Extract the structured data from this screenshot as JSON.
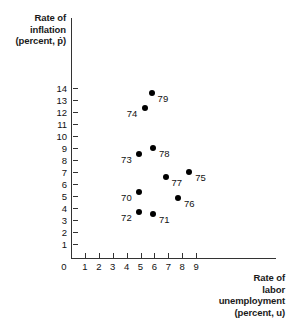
{
  "chart_data": {
    "type": "scatter",
    "title": "",
    "xlabel": "Rate of labor unemployment (percent, u)",
    "ylabel": "Rate of inflation (percent, p-dot)",
    "xlim": [
      0,
      9
    ],
    "ylim": [
      0,
      14
    ],
    "grid": false,
    "legend": "none",
    "xticks": [
      "0",
      "1",
      "2",
      "3",
      "4",
      "5",
      "6",
      "7",
      "8",
      "9"
    ],
    "yticks": [
      "1",
      "2",
      "3",
      "4",
      "5",
      "6",
      "7",
      "8",
      "9",
      "10",
      "11",
      "12",
      "13",
      "14"
    ],
    "points": [
      {
        "label": "70",
        "x": 4.9,
        "y": 5.3,
        "label_side": "left"
      },
      {
        "label": "71",
        "x": 5.9,
        "y": 3.5,
        "label_side": "right"
      },
      {
        "label": "72",
        "x": 4.9,
        "y": 3.7,
        "label_side": "left"
      },
      {
        "label": "73",
        "x": 4.9,
        "y": 8.5,
        "label_side": "left"
      },
      {
        "label": "74",
        "x": 5.3,
        "y": 12.3,
        "label_side": "left"
      },
      {
        "label": "75",
        "x": 8.5,
        "y": 7.0,
        "label_side": "right"
      },
      {
        "label": "76",
        "x": 7.7,
        "y": 4.8,
        "label_side": "right"
      },
      {
        "label": "77",
        "x": 6.8,
        "y": 6.6,
        "label_side": "right"
      },
      {
        "label": "78",
        "x": 5.9,
        "y": 9.0,
        "label_side": "right"
      },
      {
        "label": "79",
        "x": 5.8,
        "y": 13.6,
        "label_side": "right"
      }
    ]
  },
  "y_axis_title": {
    "line1": "Rate of",
    "line2": "inflation",
    "line3": "(percent, ṗ)"
  },
  "x_axis_title": {
    "line1": "Rate of",
    "line2": "labor",
    "line3": "unemployment",
    "line4": "(percent, u)"
  },
  "colors": {
    "point": "#000000",
    "axis": "#333333",
    "text": "#111111",
    "background": "#ffffff"
  }
}
